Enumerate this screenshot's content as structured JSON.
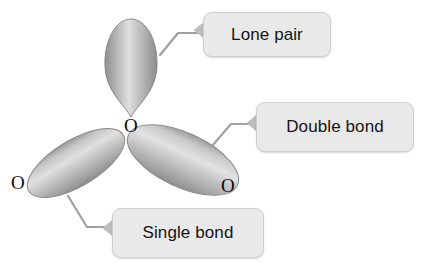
{
  "diagram": {
    "background_color": "#ffffff"
  },
  "atoms": [
    {
      "id": "center-oxygen",
      "label": "O",
      "x": 124,
      "y": 116
    },
    {
      "id": "left-terminal-oxygen",
      "label": "O",
      "x": 11,
      "y": 173
    },
    {
      "id": "right-terminal-oxygen",
      "label": "O",
      "x": 221,
      "y": 176
    }
  ],
  "orbitals": [
    {
      "id": "lone-pair-lobe",
      "shape": "teardrop",
      "cx": 131,
      "cy": 66,
      "rx": 26,
      "ry": 47,
      "rotation": 0,
      "fill_light": "#d7d7d7",
      "fill_mid": "#b4b4b4",
      "fill_dark": "#8e8e8e",
      "edge_color": "#8a8a8a"
    },
    {
      "id": "single-bond-lobe",
      "shape": "ellipse",
      "cx": 76,
      "cy": 163,
      "rx": 55,
      "ry": 23,
      "rotation": -31,
      "fill_light": "#d9d9d9",
      "fill_mid": "#b6b6b6",
      "fill_dark": "#909090",
      "edge_color": "#8a8a8a"
    },
    {
      "id": "double-bond-lobe",
      "shape": "ellipse",
      "cx": 183,
      "cy": 160,
      "rx": 60,
      "ry": 27,
      "rotation": 25,
      "fill_light": "#dadada",
      "fill_mid": "#b8b8b8",
      "fill_dark": "#929292",
      "edge_color": "#8a8a8a"
    }
  ],
  "callouts": [
    {
      "id": "lone-pair",
      "label": "Lone pair",
      "box": {
        "x": 203,
        "y": 12,
        "width": 128,
        "height": 45
      },
      "arrow_tab": {
        "tip_x": 194,
        "tip_y": 30,
        "base_x": 205,
        "base_top_y": 21,
        "base_bottom_y": 40
      },
      "leader": {
        "start_x": 160,
        "start_y": 55,
        "bend_x": 178,
        "bend_y": 33,
        "end_x": 197,
        "end_y": 33
      },
      "fill": "#e9e9e9",
      "border": "#cfcfcf",
      "text_color": "#141414"
    },
    {
      "id": "double-bond",
      "label": "Double bond",
      "box": {
        "x": 256,
        "y": 102,
        "width": 158,
        "height": 50
      },
      "arrow_tab": {
        "tip_x": 247,
        "tip_y": 123,
        "base_x": 258,
        "base_top_y": 113,
        "base_bottom_y": 133
      },
      "leader": {
        "start_x": 212,
        "start_y": 146,
        "bend_x": 231,
        "bend_y": 124,
        "end_x": 250,
        "end_y": 124
      },
      "fill": "#e9e9e9",
      "border": "#cfcfcf",
      "text_color": "#141414"
    },
    {
      "id": "single-bond",
      "label": "Single bond",
      "box": {
        "x": 112,
        "y": 208,
        "width": 152,
        "height": 50
      },
      "arrow_tab": {
        "tip_x": 103,
        "tip_y": 228,
        "base_x": 114,
        "base_top_y": 218,
        "base_bottom_y": 238
      },
      "leader": {
        "start_x": 68,
        "start_y": 196,
        "bend_x": 87,
        "bend_y": 227,
        "end_x": 106,
        "end_y": 227
      },
      "fill": "#e9e9e9",
      "border": "#cfcfcf",
      "text_color": "#141414"
    }
  ],
  "leader_style": {
    "color": "#a0a0a0",
    "width": 2.2
  }
}
